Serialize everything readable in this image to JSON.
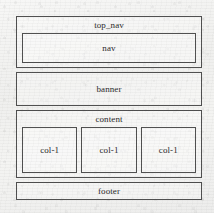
{
  "diagram": {
    "kind": "page-layout-wireframe",
    "colors": {
      "border": "#4a4a4a",
      "text": "#242424",
      "paper": "#f3f3f1"
    },
    "regions": [
      {
        "id": "top_nav",
        "label": "top_nav",
        "children": [
          {
            "id": "nav",
            "label": "nav"
          }
        ]
      },
      {
        "id": "banner",
        "label": "banner",
        "children": []
      },
      {
        "id": "content",
        "label": "content",
        "children": [
          {
            "id": "col-1-a",
            "label": "col-1"
          },
          {
            "id": "col-1-b",
            "label": "col-1"
          },
          {
            "id": "col-1-c",
            "label": "col-1"
          }
        ]
      },
      {
        "id": "footer",
        "label": "footer",
        "children": []
      }
    ]
  }
}
